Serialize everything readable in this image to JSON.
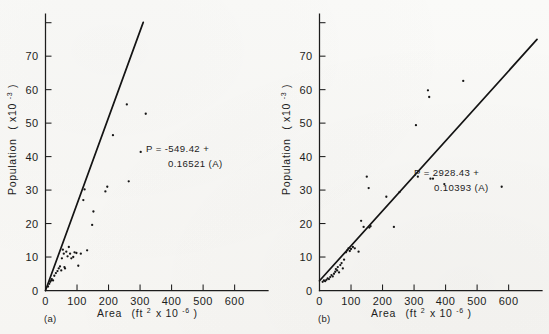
{
  "figure": {
    "background_color": "#f7f6f4",
    "ink_color": "#1d1d1d"
  },
  "chart_data": [
    {
      "type": "scatter",
      "panel_label": "(a)",
      "title": "",
      "xlabel_parts": {
        "name": "Area",
        "open": "(ft",
        "exp1": "2",
        "mid": "x 10",
        "exp2": "-6",
        "close": ")"
      },
      "ylabel_parts": {
        "name": "Population",
        "open": "( x10",
        "exp": "-3",
        "close": " )"
      },
      "xlabel": "Area (ft2 x 10-6)",
      "ylabel": "Population ( x10-3 )",
      "xlim": [
        0,
        690
      ],
      "ylim": [
        0,
        82
      ],
      "xticks": [
        0,
        100,
        200,
        300,
        400,
        500,
        600
      ],
      "yticks": [
        0,
        10,
        20,
        30,
        40,
        50,
        60,
        70
      ],
      "extra_ytick_unlabeled": 80,
      "grid": false,
      "legend": "none",
      "annotation": {
        "line1": "P = -549.42 +",
        "line2": "0.16521 (A)"
      },
      "fit": {
        "intercept": -549.42,
        "slope": 0.16521,
        "x_start": 0,
        "x_end": 310,
        "y_start": 0,
        "y_end": 80.1
      },
      "points": [
        [
          8,
          1.2
        ],
        [
          12,
          2.0
        ],
        [
          15,
          2.6
        ],
        [
          18,
          3.0
        ],
        [
          20,
          3.4
        ],
        [
          24,
          3.0
        ],
        [
          28,
          4.4
        ],
        [
          33,
          5.2
        ],
        [
          38,
          5.8
        ],
        [
          42,
          6.6
        ],
        [
          46,
          7.2
        ],
        [
          50,
          6.0
        ],
        [
          52,
          9.6
        ],
        [
          55,
          12.2
        ],
        [
          58,
          11.0
        ],
        [
          60,
          7.0
        ],
        [
          62,
          6.6
        ],
        [
          66,
          11.6
        ],
        [
          70,
          10.2
        ],
        [
          74,
          13.0
        ],
        [
          78,
          11.0
        ],
        [
          82,
          9.6
        ],
        [
          88,
          10.0
        ],
        [
          92,
          11.4
        ],
        [
          98,
          11.2
        ],
        [
          104,
          7.4
        ],
        [
          112,
          11.0
        ],
        [
          120,
          27.0
        ],
        [
          124,
          30.2
        ],
        [
          132,
          12.0
        ],
        [
          148,
          19.6
        ],
        [
          152,
          23.6
        ],
        [
          190,
          29.6
        ],
        [
          196,
          31.0
        ],
        [
          214,
          46.4
        ],
        [
          258,
          55.6
        ],
        [
          264,
          32.6
        ],
        [
          302,
          41.4
        ],
        [
          318,
          52.8
        ]
      ]
    },
    {
      "type": "scatter",
      "panel_label": "(b)",
      "title": "",
      "xlabel_parts": {
        "name": "Area",
        "open": "(ft",
        "exp1": "2",
        "mid": "x 10",
        "exp2": "-6",
        "close": ")"
      },
      "ylabel_parts": {
        "name": "Population",
        "open": "( x10",
        "exp": "-3",
        "close": " )"
      },
      "xlabel": "Area (ft2 x 10-6)",
      "ylabel": "Population ( x10-3 )",
      "xlim": [
        0,
        690
      ],
      "ylim": [
        0,
        82
      ],
      "xticks": [
        0,
        100,
        200,
        300,
        400,
        500,
        600
      ],
      "yticks": [
        0,
        10,
        20,
        30,
        40,
        50,
        60,
        70
      ],
      "extra_ytick_unlabeled": 80,
      "grid": false,
      "legend": "none",
      "annotation": {
        "line1": "P = 2928.43 +",
        "line2": "0.10393 (A)"
      },
      "fit": {
        "intercept": 2928.43,
        "slope": 0.10393,
        "x_start": 0,
        "x_end": 690,
        "y_start": 2.9,
        "y_end": 75.0
      },
      "points": [
        [
          10,
          2.6
        ],
        [
          14,
          3.0
        ],
        [
          18,
          2.8
        ],
        [
          22,
          3.2
        ],
        [
          26,
          3.6
        ],
        [
          30,
          3.4
        ],
        [
          34,
          4.0
        ],
        [
          38,
          4.6
        ],
        [
          42,
          4.2
        ],
        [
          46,
          5.0
        ],
        [
          50,
          5.6
        ],
        [
          52,
          6.4
        ],
        [
          56,
          6.0
        ],
        [
          58,
          7.0
        ],
        [
          62,
          5.4
        ],
        [
          66,
          7.6
        ],
        [
          70,
          8.2
        ],
        [
          74,
          6.6
        ],
        [
          78,
          9.2
        ],
        [
          84,
          11.4
        ],
        [
          88,
          12.0
        ],
        [
          92,
          12.6
        ],
        [
          96,
          11.8
        ],
        [
          100,
          12.4
        ],
        [
          106,
          13.0
        ],
        [
          112,
          12.6
        ],
        [
          124,
          11.6
        ],
        [
          132,
          20.8
        ],
        [
          140,
          19.0
        ],
        [
          150,
          34.0
        ],
        [
          156,
          30.6
        ],
        [
          158,
          18.8
        ],
        [
          162,
          19.2
        ],
        [
          212,
          28.0
        ],
        [
          236,
          19.0
        ],
        [
          254,
          29.4
        ],
        [
          306,
          49.4
        ],
        [
          312,
          34.0
        ],
        [
          344,
          59.8
        ],
        [
          348,
          57.8
        ],
        [
          352,
          33.4
        ],
        [
          360,
          33.4
        ],
        [
          396,
          31.8
        ],
        [
          456,
          62.6
        ],
        [
          578,
          31.0
        ]
      ]
    }
  ]
}
